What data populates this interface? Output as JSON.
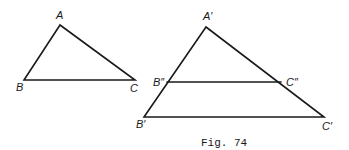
{
  "figure": {
    "caption": "Fig. 74",
    "small_triangle": {
      "vertices": {
        "A": {
          "label": "A",
          "x": 60,
          "y": 25
        },
        "B": {
          "label": "B",
          "x": 24,
          "y": 80
        },
        "C": {
          "label": "C",
          "x": 135,
          "y": 80
        }
      }
    },
    "large_triangle": {
      "vertices": {
        "A1": {
          "label": "A′",
          "x": 206,
          "y": 27
        },
        "B1": {
          "label": "B′",
          "x": 144,
          "y": 117
        },
        "C1": {
          "label": "C′",
          "x": 324,
          "y": 117
        },
        "B2": {
          "label": "B″",
          "x": 167,
          "y": 82
        },
        "C2": {
          "label": "C″",
          "x": 281,
          "y": 82
        }
      }
    }
  }
}
